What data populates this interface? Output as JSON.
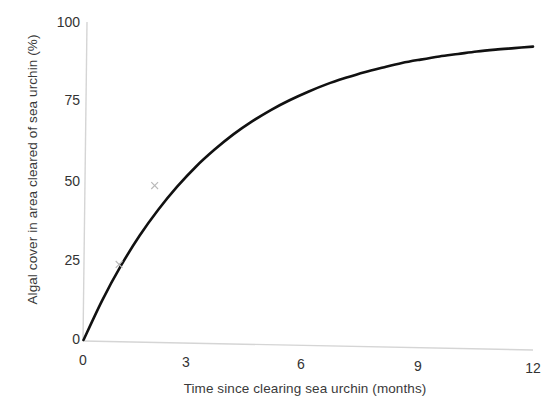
{
  "chart_data": {
    "type": "line",
    "title": "",
    "subtitle": "",
    "xlabel": "Time since clearing sea urchin (months)",
    "ylabel": "Algal cover in area cleared of sea urchin (%)",
    "xlim": [
      0,
      12
    ],
    "ylim": [
      0,
      100
    ],
    "xticks": [
      0,
      3,
      6,
      9,
      12
    ],
    "yticks": [
      0,
      25,
      50,
      75,
      100
    ],
    "xtick_labels": [
      "0",
      "3",
      "6",
      "9",
      "12"
    ],
    "ytick_labels": [
      "0",
      "25",
      "50",
      "75",
      "100"
    ],
    "grid": false,
    "legend": null,
    "legend_position": "none",
    "annotations": [],
    "series": [
      {
        "name": "Algal cover",
        "style": "smooth-curve",
        "color": "#111111",
        "line_width": 2.6,
        "x": [
          0,
          0.5,
          1,
          1.5,
          2,
          2.5,
          3,
          3.5,
          4,
          4.5,
          5,
          5.5,
          6,
          6.5,
          7,
          7.5,
          8,
          8.5,
          9,
          9.5,
          10,
          10.5,
          11,
          11.5,
          12
        ],
        "values": [
          0,
          12.6,
          23.6,
          33.2,
          41.5,
          48.8,
          55.2,
          60.7,
          65.6,
          69.8,
          73.5,
          76.7,
          79.5,
          82.0,
          84.1,
          86.0,
          87.6,
          89.1,
          90.3,
          91.4,
          92.3,
          93.2,
          93.9,
          94.5,
          95.1
        ]
      }
    ],
    "markers": {
      "symbol": "x",
      "color": "#b9b9b9",
      "points": [
        {
          "x": 0.95,
          "y": 24
        },
        {
          "x": 1.9,
          "y": 49
        }
      ]
    },
    "axis_color": "#d5d5d5",
    "background_color": "#ffffff"
  }
}
